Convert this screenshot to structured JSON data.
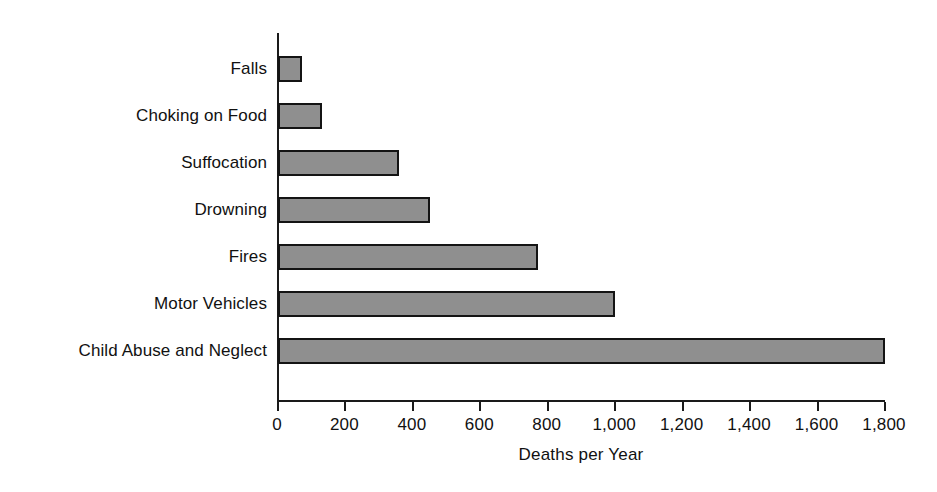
{
  "chart_data": {
    "type": "bar",
    "orientation": "horizontal",
    "title": "",
    "xlabel": "Deaths per Year",
    "ylabel": "",
    "categories": [
      "Falls",
      "Choking on Food",
      "Suffocation",
      "Drowning",
      "Fires",
      "Motor Vehicles",
      "Child Abuse and Neglect"
    ],
    "values": [
      70,
      130,
      360,
      450,
      770,
      1000,
      1800
    ],
    "xlim": [
      0,
      1800
    ],
    "xticks": [
      0,
      200,
      400,
      600,
      800,
      1000,
      1200,
      1400,
      1600,
      1800
    ],
    "xtick_labels": [
      "0",
      "200",
      "400",
      "600",
      "800",
      "1,000",
      "1,200",
      "1,400",
      "1,600",
      "1,800"
    ],
    "grid": false,
    "legend": false,
    "bar_fill_color": "#8f8f8f",
    "bar_border_color": "#141414",
    "axis_color": "#1a1a1a",
    "background_color": "#ffffff"
  }
}
